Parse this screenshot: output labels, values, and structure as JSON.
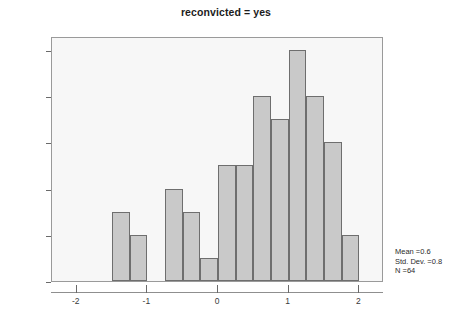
{
  "chart_data": {
    "type": "bar",
    "title": "reconvicted = yes",
    "subtitle": "",
    "xlabel": "",
    "ylabel": "",
    "xlim": [
      -2.35,
      2.35
    ],
    "ylim": [
      0,
      10.6
    ],
    "grid": false,
    "legend": null,
    "bin_width": 0.25,
    "bin_starts": [
      -1.5,
      -1.25,
      -1.0,
      -0.75,
      -0.5,
      -0.25,
      0.0,
      0.25,
      0.5,
      0.75,
      1.0,
      1.25,
      1.5,
      1.75
    ],
    "bin_centers": [
      -1.375,
      -1.125,
      -0.875,
      -0.625,
      -0.375,
      -0.125,
      0.125,
      0.375,
      0.625,
      0.875,
      1.125,
      1.375,
      1.625,
      1.875
    ],
    "categories": [
      "-1.50",
      "-1.25",
      "-1.00",
      "-0.75",
      "-0.50",
      "-0.25",
      "0.00",
      "0.25",
      "0.50",
      "0.75",
      "1.00",
      "1.25",
      "1.50",
      "1.75"
    ],
    "values": [
      3,
      2,
      0,
      4,
      3,
      1,
      5,
      5,
      8,
      7,
      10,
      8,
      6,
      2
    ],
    "x_ticks": [
      -2,
      -1,
      0,
      1,
      2
    ],
    "x_tick_labels": [
      "-2",
      "-1",
      "0",
      "1",
      "2"
    ],
    "y_ticks": [
      0,
      2,
      4,
      6,
      8,
      10
    ],
    "y_tick_labels": [
      "0",
      "2",
      "4",
      "6",
      "8",
      "10"
    ],
    "colors": {
      "bar_fill": "#c9c9c9",
      "bar_border": "#6e6e6e",
      "plot_background": "#f7f7f7",
      "frame": "#9a9a9a",
      "text": "#2b2b2b",
      "page_background": "#ffffff"
    }
  },
  "annotations": {
    "stats": {
      "mean_label": "Mean =0.6",
      "std_dev_label": "Std. Dev. =0.8",
      "n_label": "N =64"
    }
  }
}
